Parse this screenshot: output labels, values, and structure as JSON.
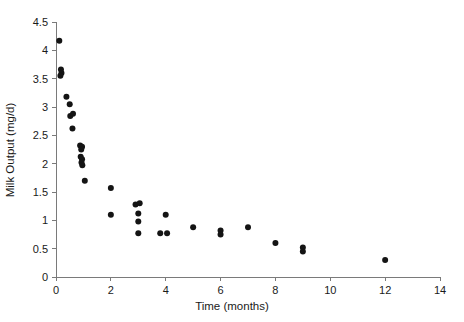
{
  "chart_data": {
    "type": "scatter",
    "title": "",
    "xlabel": "Time (months)",
    "ylabel": "Milk Output (mg/d)",
    "xlim": [
      0,
      14
    ],
    "ylim": [
      0,
      4.5
    ],
    "xticks": [
      0,
      2,
      4,
      6,
      8,
      10,
      12,
      14
    ],
    "yticks": [
      0,
      0.5,
      1,
      1.5,
      2,
      2.5,
      3,
      3.5,
      4,
      4.5
    ],
    "xtick_labels": [
      "0",
      "2",
      "4",
      "6",
      "8",
      "10",
      "12",
      "14"
    ],
    "ytick_labels": [
      "0",
      "0.5",
      "1",
      "1.5",
      "2",
      "2.5",
      "3",
      "3.5",
      "4",
      "4.5"
    ],
    "grid": false,
    "legend": false,
    "legend_position": "none",
    "marker": "filled-circle",
    "marker_color": "#141414",
    "marker_size": 3,
    "series": [
      {
        "name": "Milk output",
        "points": [
          [
            0.12,
            4.17
          ],
          [
            0.18,
            3.66
          ],
          [
            0.2,
            3.6
          ],
          [
            0.16,
            3.55
          ],
          [
            0.38,
            3.18
          ],
          [
            0.5,
            3.05
          ],
          [
            0.52,
            2.84
          ],
          [
            0.62,
            2.88
          ],
          [
            0.6,
            2.62
          ],
          [
            0.88,
            2.32
          ],
          [
            0.95,
            2.3
          ],
          [
            0.92,
            2.25
          ],
          [
            0.9,
            2.12
          ],
          [
            0.95,
            2.08
          ],
          [
            0.93,
            2.02
          ],
          [
            0.96,
            1.97
          ],
          [
            1.05,
            1.7
          ],
          [
            2.0,
            1.57
          ],
          [
            2.0,
            1.1
          ],
          [
            2.9,
            1.28
          ],
          [
            3.05,
            1.3
          ],
          [
            3.0,
            1.12
          ],
          [
            3.0,
            0.98
          ],
          [
            3.0,
            0.77
          ],
          [
            3.8,
            0.77
          ],
          [
            4.0,
            1.1
          ],
          [
            4.05,
            0.77
          ],
          [
            5.0,
            0.88
          ],
          [
            6.0,
            0.82
          ],
          [
            6.0,
            0.75
          ],
          [
            7.0,
            0.88
          ],
          [
            8.0,
            0.6
          ],
          [
            9.0,
            0.52
          ],
          [
            9.0,
            0.45
          ],
          [
            12.0,
            0.3
          ]
        ]
      }
    ]
  },
  "axes": {
    "x_axis_title": "Time (months)",
    "y_axis_title": "Milk Output (mg/d)"
  },
  "colors": {
    "axis": "#7a7a7a",
    "text": "#1a1a1a",
    "marker": "#141414",
    "background": "#ffffff"
  }
}
